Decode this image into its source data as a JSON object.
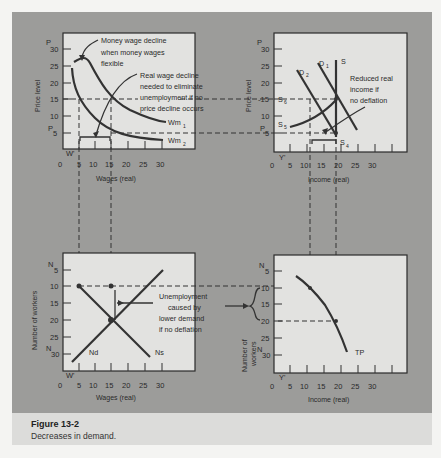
{
  "caption": {
    "title": "Figure 13-2",
    "text": "Decreases in demand."
  },
  "panels": {
    "top_left": {
      "y_axis_label": "Price level",
      "x_axis_label": "Wages (real)",
      "y_ticks": [
        "30",
        "25",
        "20",
        "15",
        "10",
        "5"
      ],
      "y_prefix_top": "P",
      "y_prefix_bottom": "P",
      "x_ticks": [
        "0",
        "5",
        "10",
        "15",
        "20",
        "25",
        "30"
      ],
      "origin_label": "W'",
      "curves": [
        "Wm1",
        "Wm2"
      ],
      "curve_labels": {
        "wm1": "Wm",
        "wm1_sub": "1",
        "wm2": "Wm",
        "wm2_sub": "2"
      },
      "annotation_1": [
        "Money wage decline",
        "when money wages",
        "flexible"
      ],
      "annotation_2": [
        "Real wage decline",
        "needed to eliminate",
        "unemployment if no",
        "price decline occurs"
      ]
    },
    "top_right": {
      "y_axis_label": "Price level",
      "x_axis_label": "Income (real)",
      "y_ticks": [
        "30",
        "25",
        "20",
        "-15",
        "10",
        "5"
      ],
      "x_ticks": [
        "0",
        "5",
        "10",
        "15",
        "20",
        "25",
        "30"
      ],
      "origin_label": "Y'",
      "curve_labels": {
        "d1": "D",
        "d1_sub": "1",
        "d2": "D",
        "d2_sub": "2",
        "s": "S",
        "s4": "S",
        "s4_sub": "4",
        "s5": "S",
        "s5_sub": "5",
        "s6": "S",
        "s6_sub": "6"
      },
      "annotation": [
        "Reduced real",
        "income if",
        "no deflation"
      ]
    },
    "bottom_left": {
      "y_axis_label": "Number of workers",
      "x_axis_label": "Wages (real)",
      "y_ticks": [
        "5",
        "10",
        "15",
        "20",
        "25",
        "30"
      ],
      "x_ticks": [
        "0",
        "5",
        "10",
        "15",
        "20",
        "25",
        "30"
      ],
      "origin_label": "W'",
      "curve_labels": {
        "nd": "Nd",
        "ns": "Ns"
      },
      "annotation": [
        "Unemployment",
        "caused by",
        "lower demand",
        "if no deflation"
      ]
    },
    "bottom_right": {
      "y_axis_label_1": "Number of",
      "y_axis_label_2": "workers",
      "x_axis_label": "Income (real)",
      "y_ticks": [
        "5",
        "10",
        "15",
        "20",
        "25",
        "30"
      ],
      "x_ticks": [
        "0",
        "5",
        "10",
        "15",
        "20",
        "25",
        "30"
      ],
      "origin_label": "Y'",
      "curve_labels": {
        "tp": "TP"
      }
    }
  },
  "colors": {
    "panel_bg": "#9c9c9a",
    "plot_bg": "#e2e2e0",
    "ink": "#2a2a2a"
  }
}
